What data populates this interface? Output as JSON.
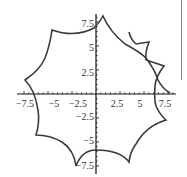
{
  "chart_data": {
    "type": "line",
    "title": "",
    "xlabel": "",
    "ylabel": "",
    "xlim": [
      -7.8,
      7.8
    ],
    "ylim": [
      -8,
      8
    ],
    "grid": false,
    "legend": null,
    "x_ticks": [
      "-7.5",
      "-5",
      "-2.5",
      "2.5",
      "5",
      "7.5"
    ],
    "y_ticks": [
      "7.5",
      "5",
      "2.5",
      "-2.5",
      "-5",
      "-7.5"
    ],
    "series": [
      {
        "name": "curve",
        "color": "#3a3a3a",
        "cusps_approx": [
          {
            "x": 0.7,
            "y": 8.1
          },
          {
            "x": -4.6,
            "y": 6.6
          },
          {
            "x": -7.4,
            "y": 1.4
          },
          {
            "x": -6.2,
            "y": -4.3
          },
          {
            "x": -2.1,
            "y": -7.6
          },
          {
            "x": 3.4,
            "y": -7.2
          },
          {
            "x": 7.3,
            "y": -2.8
          },
          {
            "x": 7.7,
            "y": 0.0
          },
          {
            "x": 7.0,
            "y": 2.8
          },
          {
            "x": 5.5,
            "y": 5.2
          }
        ],
        "start_point": {
          "x": 3.4,
          "y": 6.4
        }
      }
    ]
  },
  "axes": {
    "x_labels": [
      {
        "text": "−7.5",
        "value": -7.5
      },
      {
        "text": "−5",
        "value": -5
      },
      {
        "text": "−2.5",
        "value": -2.5
      },
      {
        "text": "2.5",
        "value": 2.5
      },
      {
        "text": "5",
        "value": 5
      },
      {
        "text": "7.5",
        "value": 7.5
      }
    ],
    "y_labels": [
      {
        "text": "7.5",
        "value": 7.5
      },
      {
        "text": "5",
        "value": 5
      },
      {
        "text": "2.5",
        "value": 2.5
      },
      {
        "text": "−2.5",
        "value": -2.5
      },
      {
        "text": "−5",
        "value": -5
      },
      {
        "text": "−7.5",
        "value": -7.5
      }
    ]
  }
}
